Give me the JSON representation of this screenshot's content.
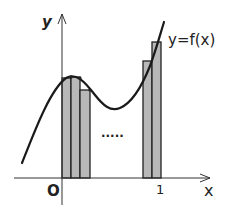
{
  "diagram": {
    "type": "riemann-sum-illustration",
    "curve_label": "y=f(x)",
    "axis_labels": {
      "y": "y",
      "x": "x"
    },
    "tick_labels": {
      "origin": "O",
      "one": "1"
    },
    "ellipsis": "·····",
    "colors": {
      "bar_fill": "#b8b8b8",
      "stroke": "#222222",
      "background": "#ffffff"
    },
    "bars_left": [
      {
        "x0": 62,
        "x1": 71,
        "top": 78
      },
      {
        "x0": 71,
        "x1": 80,
        "top": 77
      },
      {
        "x0": 80,
        "x1": 90,
        "top": 90
      }
    ],
    "bars_right": [
      {
        "x0": 143,
        "x1": 152,
        "top": 61
      },
      {
        "x0": 152,
        "x1": 161,
        "top": 42
      }
    ]
  }
}
